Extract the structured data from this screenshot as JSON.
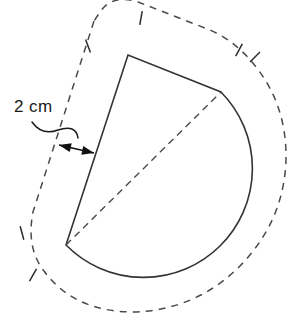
{
  "figure": {
    "dimension_label": {
      "text": "2 cm",
      "value": 2,
      "unit": "cm",
      "x": 14,
      "y": 112
    },
    "colors": {
      "solid_stroke": "#333333",
      "dashed_stroke": "#4a4a4a",
      "tick_stroke": "#2b2b2b",
      "arrow_fill": "#111111",
      "text": "#1a1a1a",
      "background": "#ffffff"
    },
    "solid_shape": {
      "name": "sector",
      "center_vertex": {
        "x": 66,
        "y": 245
      },
      "top_vertex": {
        "x": 128,
        "y": 55
      },
      "arc_start_vertex": {
        "x": 221,
        "y": 92
      },
      "arc_right_extreme": {
        "x": 262,
        "y": 196
      },
      "arc_bottom_extreme": {
        "x": 155,
        "y": 281
      },
      "path": "M 66 245 L 128 55 L 221 92 A 96 96 0 0 1 66 245 Z",
      "stroke_width": 1.6
    },
    "interior_dashed_radius": {
      "name": "radius-line",
      "from": {
        "x": 66,
        "y": 245
      },
      "to": {
        "x": 221,
        "y": 92
      },
      "dash_pattern": "7,5"
    },
    "offset_outline": {
      "name": "offset-boundary",
      "offset_distance_cm": 2,
      "dash_pattern": "7,6",
      "path": "M 94 21 L 33 212 Q 26 248 44 271 Q 74 312 134 312 Q 196 310 240 266 Q 284 221 286 160 Q 287 106 256 67 Q 237 42 210 30 L 138 2 Q 112 -6 100 12 Z"
    },
    "tick_marks": [
      {
        "id": "tick-top-left",
        "x": 88,
        "y": 46,
        "angle": 70
      },
      {
        "id": "tick-top",
        "x": 141,
        "y": 18,
        "angle": 100
      },
      {
        "id": "tick-top-right-a",
        "x": 239,
        "y": 50,
        "angle": 118
      },
      {
        "id": "tick-top-right-b",
        "x": 255,
        "y": 57,
        "angle": 135
      },
      {
        "id": "tick-left-upper",
        "x": 22,
        "y": 233,
        "angle": 75
      },
      {
        "id": "tick-left-lower",
        "x": 33,
        "y": 275,
        "angle": 120
      }
    ],
    "dimension_arrow": {
      "name": "double-headed-arrow",
      "from": {
        "x": 59,
        "y": 145
      },
      "to": {
        "x": 94,
        "y": 153
      },
      "heads": 2
    },
    "leader_line": {
      "name": "curved-leader",
      "path": "M 32 122 Q 42 136 58 130 Q 76 124 78 138"
    }
  }
}
